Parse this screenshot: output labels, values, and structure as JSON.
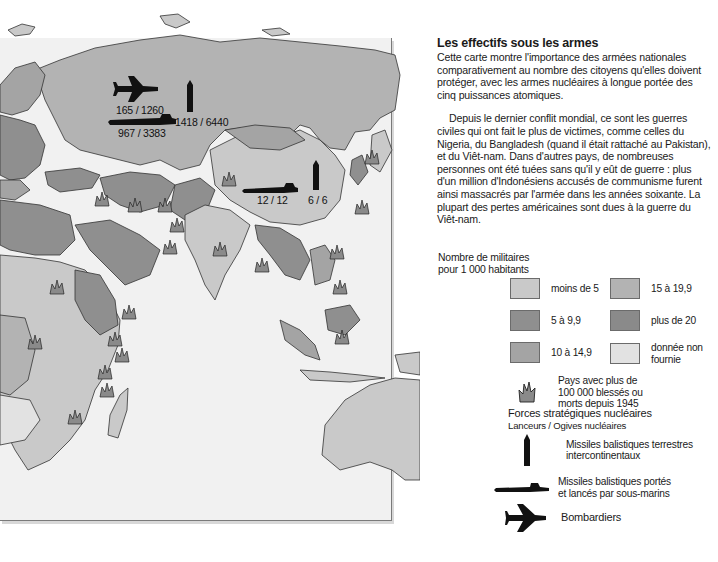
{
  "map": {
    "region": "Europe, Africa, Asia, Oceania",
    "nuclear_labels": {
      "ussr_bombers": "165 / 1260",
      "ussr_submarines": "967 / 3383",
      "ussr_icbm": "1418 / 6440",
      "china_submarines": "12 / 12",
      "china_icbm": "6 / 6"
    }
  },
  "text": {
    "title": "Les effectifs sous les armes",
    "intro": "Cette carte montre l'importance des armées nationales comparativement au nombre des citoyens qu'elles doivent protéger, avec les armes nucléaires à longue portée des cinq puissances atomiques.",
    "body": "Depuis le dernier conflit mondial, ce sont les guerres civiles qui ont fait le plus de victimes, comme celles du Nigeria, du Bangladesh (quand il était rattaché au Pakistan), et du Viêt-nam. Dans d'autres pays, de nombreuses personnes ont été tuées sans qu'il y eût de guerre : plus d'un million d'Indonésiens accusés de communisme furent ainsi massacrés par l'armée dans les années soixante. La plupart des pertes américaines sont dues à la guerre du Viêt-nam."
  },
  "legend": {
    "title_line1": "Nombre de militaires",
    "title_line2": "pour 1 000 habitants",
    "classes": [
      {
        "label": "moins de 5",
        "color": "#c9c9c9"
      },
      {
        "label": "5 à 9,9",
        "color": "#8f8f8f"
      },
      {
        "label": "10 à 14,9",
        "color": "#a4a4a4"
      },
      {
        "label": "15 à 19,9",
        "color": "#b3b3b3"
      },
      {
        "label": "plus de 20",
        "color": "#8a8a8a"
      },
      {
        "label_line1": "donnée non",
        "label_line2": "fournie",
        "color": "#e2e2e2"
      }
    ],
    "casualties": {
      "line1": "Pays avec plus de",
      "line2": "100 000 blessés ou",
      "line3": "morts depuis 1945",
      "icon": "flame-icon"
    },
    "nuclear": {
      "title": "Forces stratégiques nucléaires",
      "subtitle": "Lanceurs / Ogives nucléaires",
      "items": [
        {
          "icon": "missile-icon",
          "line1": "Missiles balistiques terrestres",
          "line2": "intercontinentaux"
        },
        {
          "icon": "submarine-icon",
          "line1": "Missiles balistiques portés",
          "line2": "et lancés par sous-marins"
        },
        {
          "icon": "bomber-icon",
          "line1": "Bombardiers"
        }
      ]
    }
  }
}
